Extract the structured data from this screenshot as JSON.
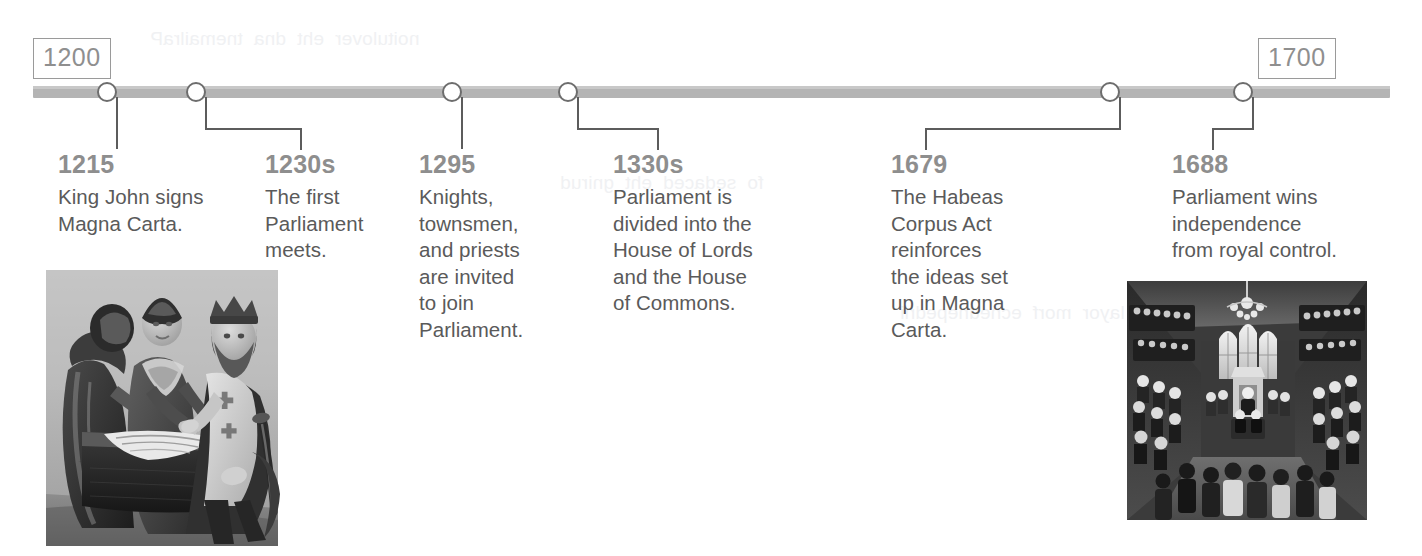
{
  "timeline": {
    "axis": {
      "start_label": "1200",
      "end_label": "1700",
      "bar_color": "#b4b4b4"
    },
    "entries": [
      {
        "year": "1215",
        "description": "King John signs\nMagna Carta.",
        "marker_x": 107,
        "connector": "straight"
      },
      {
        "year": "1230s",
        "description": "The first\nParliament\nmeets.",
        "marker_x": 196,
        "connector": "step-right"
      },
      {
        "year": "1295",
        "description": "Knights,\ntownsmen,\nand priests\nare invited\nto join\nParliament.",
        "marker_x": 452,
        "connector": "straight"
      },
      {
        "year": "1330s",
        "description": "Parliament is\ndivided into the\nHouse of Lords\nand the House\nof Commons.",
        "marker_x": 568,
        "connector": "step-right"
      },
      {
        "year": "1679",
        "description": "The Habeas\nCorpus Act\nreinforces\nthe ideas set\nup in Magna\nCarta.",
        "marker_x": 1110,
        "connector": "step-left"
      },
      {
        "year": "1688",
        "description": "Parliament wins\nindependence\nfrom royal control.",
        "marker_x": 1243,
        "connector": "step-left"
      }
    ]
  },
  "figures": {
    "magna_carta": {
      "caption_alt": "King John signing Magna Carta, grayscale engraving"
    },
    "house_of_commons": {
      "caption_alt": "Interior of the House of Commons chamber, grayscale painting"
    }
  },
  "bleed_text": {
    "line_a": "noitulover  eht  dna  tnemailraP",
    "line_b": "fo  sedaced  eht  gnirud",
    "line_c": "lortnoc  layor  morf  ecnednepedni"
  },
  "colors": {
    "year_heading": "#8e8e8e",
    "body_text": "#5a5a5a",
    "axis": "#b4b4b4",
    "node_ring": "#6d6d6d",
    "connector": "#5c5c5c",
    "box_border": "#9a9a9a"
  }
}
